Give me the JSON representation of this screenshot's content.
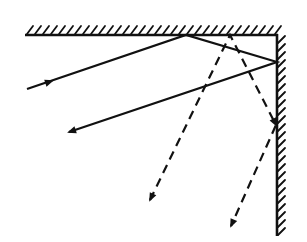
{
  "diagram": {
    "width": 307,
    "height": 242,
    "background": "#ffffff",
    "ink": "#111111",
    "mirrors": {
      "top": {
        "x1": 25,
        "y1": 35,
        "x2": 277,
        "y2": 35,
        "hatch_side": "above",
        "hatch_spacing": 8
      },
      "right": {
        "x1": 277,
        "y1": 35,
        "x2": 277,
        "y2": 236,
        "hatch_side": "right",
        "hatch_spacing": 8
      }
    },
    "solid_ray": {
      "style": "solid",
      "points": [
        [
          27,
          89
        ],
        [
          186,
          35
        ],
        [
          277,
          62
        ],
        [
          69,
          132
        ]
      ],
      "arrows": [
        {
          "at": [
            52,
            81
          ],
          "dir": [
            1,
            -0.34
          ]
        },
        {
          "at": [
            69,
            132
          ],
          "dir": [
            -1,
            0.34
          ]
        }
      ]
    },
    "dashed_ray": {
      "style": "dashed",
      "points": [
        [
          150,
          200
        ],
        [
          230,
          35
        ],
        [
          276,
          125
        ],
        [
          231,
          226
        ]
      ],
      "arrows": [
        {
          "at": [
            150,
            200
          ],
          "dir": [
            -0.44,
            0.9
          ]
        },
        {
          "at": [
            276,
            125
          ],
          "dir": [
            0.45,
            0.89
          ]
        },
        {
          "at": [
            231,
            226
          ],
          "dir": [
            -0.41,
            0.91
          ]
        }
      ]
    }
  }
}
